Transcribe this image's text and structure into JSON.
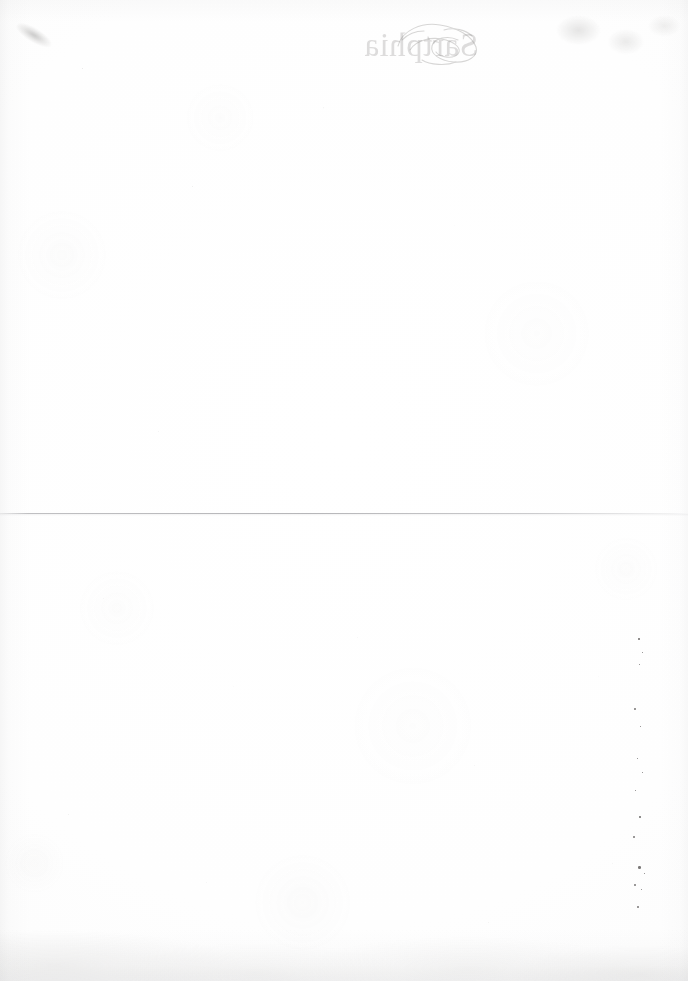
{
  "document": {
    "kind": "scanned-book-page",
    "condition": "blank verso, age-toned with foxing and speckles",
    "page_width": 688,
    "page_height": 981,
    "paper_color": "#fefefe",
    "body_text": ""
  },
  "bleed_through": {
    "note": "mirrored show-through of the title printed on the reverse side of the leaf",
    "title_text": "Sartphia",
    "ornament_name": "decorative-flourish",
    "ink_color": "#7e7c7a"
  },
  "rule": {
    "name": "horizontal-rule",
    "color": "#acacaf",
    "y_position": 513
  },
  "marks": {
    "top_left_smudge": "diagonal-ink-smudge",
    "right_speck_column": [
      {
        "x": 10,
        "y": 8,
        "d": 1.6
      },
      {
        "x": 14,
        "y": 22,
        "d": 1.3
      },
      {
        "x": 11,
        "y": 34,
        "d": 1.2
      },
      {
        "x": 6,
        "y": 78,
        "d": 1.8
      },
      {
        "x": 12,
        "y": 96,
        "d": 1.1
      },
      {
        "x": 9,
        "y": 128,
        "d": 1.4
      },
      {
        "x": 14,
        "y": 142,
        "d": 1.0
      },
      {
        "x": 7,
        "y": 160,
        "d": 1.2
      },
      {
        "x": 11,
        "y": 186,
        "d": 1.5
      },
      {
        "x": 5,
        "y": 206,
        "d": 2.2
      },
      {
        "x": 10,
        "y": 236,
        "d": 2.6
      },
      {
        "x": 16,
        "y": 243,
        "d": 1.3
      },
      {
        "x": 6,
        "y": 254,
        "d": 2.0
      },
      {
        "x": 13,
        "y": 259,
        "d": 1.2
      },
      {
        "x": 9,
        "y": 276,
        "d": 2.4
      }
    ]
  }
}
